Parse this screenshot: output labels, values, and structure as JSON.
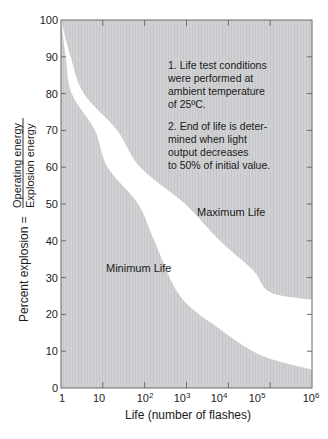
{
  "chart_data": {
    "type": "area",
    "title": "",
    "xlabel": "Life (number of flashes)",
    "ylabel": "Percent explosion = Operating energy / Explosion energy",
    "ylabel_parts": {
      "prefix": "Percent explosion =",
      "numerator": "Operating energy",
      "denominator": "Explosion energy"
    },
    "x_scale": "log",
    "xlim": [
      1,
      1000000
    ],
    "ylim": [
      0,
      100
    ],
    "x_ticks": [
      {
        "label": "1",
        "value": 1
      },
      {
        "label": "10",
        "value": 10
      },
      {
        "label": "10",
        "sup": "2",
        "value": 100
      },
      {
        "label": "10",
        "sup": "3",
        "value": 1000
      },
      {
        "label": "10",
        "sup": "4",
        "value": 10000
      },
      {
        "label": "10",
        "sup": "5",
        "value": 100000
      },
      {
        "label": "10",
        "sup": "6",
        "value": 1000000
      }
    ],
    "y_ticks": [
      0,
      10,
      20,
      30,
      40,
      50,
      60,
      70,
      80,
      90,
      100
    ],
    "grid": false,
    "series": [
      {
        "name": "Minimum Life",
        "x": [
          1,
          1.3,
          1.8,
          6.5,
          13,
          70,
          170,
          700,
          6300,
          58000,
          1000000
        ],
        "y": [
          100,
          90,
          80,
          70,
          60,
          50,
          40,
          25,
          16,
          9,
          5
        ]
      },
      {
        "name": "Maximum Life",
        "x": [
          1,
          1.7,
          3.5,
          22,
          78,
          930,
          6300,
          39000,
          100000,
          1000000
        ],
        "y": [
          100,
          90,
          80,
          70,
          60,
          50,
          40,
          32,
          26,
          24
        ]
      }
    ],
    "region_labels": [
      "Minimum Life",
      "Maximum Life"
    ],
    "annotations": [
      "1. Life test conditions were performed at ambient temperature of 25ºC.",
      "2. End of life is determined when light output decreases to 50% of initial value."
    ],
    "colors": {
      "shaded": "#cfd0d2",
      "band": "#ffffff",
      "axis": "#555555"
    }
  },
  "notes": {
    "note1": [
      "1.  Life test conditions",
      "were performed at",
      "ambient temperature",
      "of 25ºC."
    ],
    "note2": [
      "2.  End of life is deter-",
      "mined when light",
      "output decreases",
      "to 50% of initial value."
    ]
  },
  "labels": {
    "max_life": "Maximum Life",
    "min_life": "Minimum Life",
    "xlabel": "Life (number of flashes)",
    "y_prefix": "Percent explosion =",
    "y_num": "Operating energy",
    "y_den": "Explosion energy"
  },
  "y_tick_labels": [
    "0",
    "10",
    "20",
    "30",
    "40",
    "50",
    "60",
    "70",
    "80",
    "90",
    "100"
  ],
  "x_tick_labels": [
    {
      "base": "1",
      "sup": ""
    },
    {
      "base": "10",
      "sup": ""
    },
    {
      "base": "10",
      "sup": "2"
    },
    {
      "base": "10",
      "sup": "3"
    },
    {
      "base": "10",
      "sup": "4"
    },
    {
      "base": "10",
      "sup": "5"
    },
    {
      "base": "10",
      "sup": "6"
    }
  ]
}
